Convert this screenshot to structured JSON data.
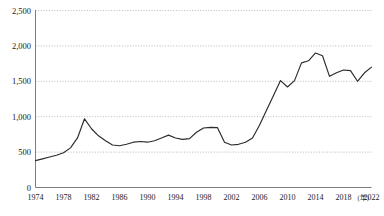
{
  "chart_data": {
    "type": "line",
    "title": "",
    "subtitle": "",
    "xlabel": "",
    "ylabel": "",
    "x_unit_label": "(年)",
    "grid": true,
    "legend": false,
    "legend_position": "none",
    "xlim": [
      1974,
      2022
    ],
    "ylim": [
      0,
      2500
    ],
    "y_ticks": [
      0,
      500,
      1000,
      1500,
      2000,
      2500
    ],
    "y_tick_labels": [
      "0",
      "500",
      "1,000",
      "1,500",
      "2,000",
      "2,500"
    ],
    "x_ticks": [
      1974,
      1978,
      1982,
      1986,
      1990,
      1994,
      1998,
      2002,
      2006,
      2010,
      2014,
      2018,
      2022
    ],
    "x_tick_labels": [
      "1974",
      "1978",
      "1982",
      "1986",
      "1990",
      "1994",
      "1998",
      "2002",
      "2006",
      "2010",
      "2014",
      "2018",
      "2022"
    ],
    "series": [
      {
        "name": "series-1",
        "color": "#2b2b2b",
        "x": [
          1974,
          1975,
          1976,
          1977,
          1978,
          1979,
          1980,
          1981,
          1982,
          1983,
          1984,
          1985,
          1986,
          1987,
          1988,
          1989,
          1990,
          1991,
          1992,
          1993,
          1994,
          1995,
          1996,
          1997,
          1998,
          1999,
          2000,
          2001,
          2002,
          2003,
          2004,
          2005,
          2006,
          2007,
          2008,
          2009,
          2010,
          2011,
          2012,
          2013,
          2014,
          2015,
          2016,
          2017,
          2018,
          2019,
          2020,
          2021,
          2022
        ],
        "values": [
          380,
          405,
          430,
          455,
          490,
          560,
          700,
          970,
          830,
          730,
          660,
          600,
          590,
          610,
          640,
          650,
          640,
          660,
          700,
          740,
          700,
          680,
          690,
          780,
          840,
          850,
          845,
          640,
          600,
          610,
          640,
          700,
          880,
          1090,
          1300,
          1510,
          1420,
          1510,
          1760,
          1790,
          1900,
          1860,
          1570,
          1620,
          1660,
          1650,
          1500,
          1620,
          1700
        ]
      }
    ]
  }
}
